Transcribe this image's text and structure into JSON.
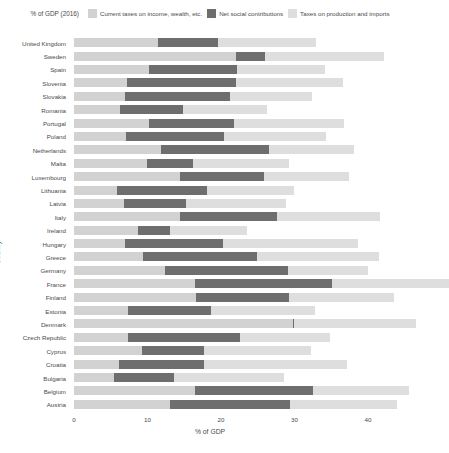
{
  "legend": {
    "title": "% of GDP (2016)",
    "items": [
      {
        "label": "Current taxes on income, wealth, etc.",
        "color": "#d2d2d2"
      },
      {
        "label": "Net social contributions",
        "color": "#6e6e6e"
      },
      {
        "label": "Taxes on production and imports",
        "color": "#dedede"
      }
    ]
  },
  "axes": {
    "x_title": "% of GDP",
    "y_title": "Country",
    "x_ticks": [
      "0",
      "10",
      "20",
      "30",
      "40"
    ]
  },
  "chart_data": {
    "type": "bar",
    "orientation": "horizontal",
    "stacked": true,
    "title": "% of GDP (2016)",
    "xlabel": "% of GDP",
    "ylabel": "Country",
    "xlim": [
      0,
      46
    ],
    "grid": false,
    "legend_position": "top",
    "xticks": [
      0,
      10,
      20,
      30,
      40
    ],
    "categories": [
      "United Kingdom",
      "Sweden",
      "Spain",
      "Slovenia",
      "Slovakia",
      "Romania",
      "Portugal",
      "Poland",
      "Netherlands",
      "Malta",
      "Luxembourg",
      "Lithuania",
      "Latvia",
      "Italy",
      "Ireland",
      "Hungary",
      "Greece",
      "Germany",
      "France",
      "Finland",
      "Estonia",
      "Denmark",
      "Czech Republic",
      "Cyprus",
      "Croatia",
      "Bulgaria",
      "Belgium",
      "Austria"
    ],
    "series": [
      {
        "name": "Current taxes on income, wealth, etc.",
        "color": "#d2d2d2",
        "values": [
          11.4,
          22.1,
          10.2,
          7.2,
          6.9,
          6.2,
          10.2,
          7.1,
          11.8,
          10.0,
          14.4,
          5.8,
          6.8,
          14.4,
          8.7,
          6.9,
          9.4,
          12.4,
          16.4,
          16.6,
          7.4,
          29.8,
          7.4,
          9.3,
          6.1,
          5.4,
          16.5,
          13.0
        ]
      },
      {
        "name": "Net social contributions",
        "color": "#6e6e6e",
        "values": [
          8.2,
          3.9,
          12.0,
          14.8,
          14.4,
          8.7,
          11.6,
          13.3,
          14.7,
          6.2,
          11.4,
          12.3,
          8.5,
          13.2,
          4.4,
          13.4,
          15.5,
          16.7,
          18.7,
          12.7,
          11.3,
          0.1,
          15.2,
          8.4,
          11.6,
          8.2,
          16.0,
          16.4
        ]
      },
      {
        "name": "Taxes on production and imports",
        "color": "#dedede",
        "values": [
          13.3,
          16.2,
          11.9,
          14.6,
          11.1,
          11.4,
          14.9,
          13.9,
          11.6,
          13.1,
          11.6,
          11.9,
          13.6,
          14.0,
          10.5,
          18.3,
          16.6,
          10.9,
          15.9,
          14.3,
          14.1,
          16.7,
          12.2,
          14.6,
          19.4,
          15.0,
          13.1,
          14.5
        ]
      }
    ],
    "totals": [
      32.9,
      42.2,
      34.1,
      36.6,
      32.4,
      26.3,
      36.7,
      34.3,
      38.1,
      29.3,
      37.4,
      30.0,
      28.9,
      41.6,
      23.6,
      38.6,
      41.5,
      40.0,
      51.0,
      43.6,
      32.8,
      46.6,
      34.8,
      32.3,
      37.1,
      28.6,
      45.6,
      43.9
    ]
  }
}
